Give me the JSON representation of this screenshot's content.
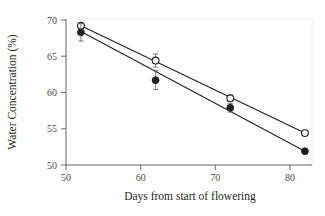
{
  "chart_data": {
    "type": "scatter",
    "title": "",
    "xlabel": "Days from start of flowering",
    "ylabel": "Water Concentration (%)",
    "xlim": [
      49,
      86
    ],
    "ylim": [
      50,
      70
    ],
    "xticks": [
      "50",
      "60",
      "70",
      "80"
    ],
    "xtick_values": [
      50,
      60,
      70,
      80
    ],
    "yticks": [
      "50",
      "55",
      "60",
      "65",
      "70"
    ],
    "ytick_values": [
      50,
      55,
      60,
      65,
      70
    ],
    "grid": false,
    "legend": "none",
    "x": [
      52,
      62,
      72,
      82
    ],
    "series": [
      {
        "name": "open-circle-series",
        "marker": "open-circle",
        "values": [
          69.2,
          64.4,
          59.2,
          54.4
        ],
        "errors": [
          0.35,
          0.9,
          0.45,
          0.3
        ],
        "fit_line": {
          "x": [
            52,
            82
          ],
          "y": [
            69.2,
            54.4
          ]
        }
      },
      {
        "name": "filled-circle-series",
        "marker": "filled-circle",
        "values": [
          68.3,
          61.7,
          57.9,
          51.9
        ],
        "errors": [
          1.2,
          1.3,
          0.6,
          0.3
        ],
        "fit_line": {
          "x": [
            52,
            82
          ],
          "y": [
            68.4,
            51.9
          ]
        }
      }
    ],
    "colors": {
      "marker_fill_open": "#ffffff",
      "marker_fill_closed": "#231f20",
      "marker_stroke": "#231f20",
      "line": "#231f20",
      "axis": "#58595b",
      "text": "#231f20",
      "background": "#ffffff"
    }
  }
}
